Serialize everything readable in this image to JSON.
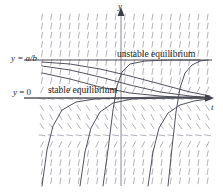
{
  "figure": {
    "background_color": "#ffffff",
    "width": 223,
    "height": 192
  },
  "axes": {
    "vertical": {
      "label": "y",
      "x_pixel": 121,
      "top_pixel": 8,
      "bottom_pixel": 186
    },
    "horizontal": {
      "label": "t",
      "y_pixel": 98,
      "left_pixel": 24,
      "right_pixel": 214
    },
    "axis_color": "#6b6b78"
  },
  "equilibria": [
    {
      "id": "unstable",
      "value_label": "y = a/b",
      "value_label_lhs": "y",
      "value_label_rhs": " = a/b",
      "annotation": "unstable equilibrium",
      "y_pixel": 60,
      "line_color": "#555555"
    },
    {
      "id": "stable",
      "value_label": "y = 0",
      "value_label_lhs": "y",
      "value_label_rhs": " = 0",
      "annotation": "stable equilibrium",
      "y_pixel": 98,
      "line_color": "#555555"
    }
  ],
  "direction_field": {
    "tick_color": "#9a9aa5",
    "x_start": 42,
    "x_step": 9.2,
    "x_count": 19,
    "y_start": 17,
    "y_step": 9.1,
    "y_count": 19,
    "tick_length": 6,
    "description": "short slope segments; near-horizontal at the two equilibria, steep positive above y=a/b, negative between the equilibria, steep positive below y=0"
  },
  "solution_curves": {
    "curve_color": "#4a4a55",
    "stroke_width": 0.9,
    "count": 8,
    "regions": [
      {
        "region": "above y = a/b",
        "behaviour": "diverges upward away from unstable equilibrium",
        "count": 2
      },
      {
        "region": "between y = 0 and y = a/b",
        "behaviour": "decays downward toward stable equilibrium y = 0",
        "count": 3
      },
      {
        "region": "below y = 0",
        "behaviour": "rises asymptotically toward stable equilibrium y = 0",
        "count": 3
      }
    ]
  },
  "chart_data": {
    "type": "line",
    "xlabel": "t",
    "ylabel": "y",
    "grid": false,
    "legend": "none",
    "xlim": [
      0,
      223
    ],
    "ylim": [
      192,
      0
    ],
    "annotations": [
      {
        "text": "unstable equilibrium",
        "x": 117,
        "y": 50
      },
      {
        "text": "stable equilibrium",
        "x": 48,
        "y": 86
      },
      {
        "text": "y = a/b",
        "x": 11,
        "y": 54
      },
      {
        "text": "y = 0",
        "x": 13,
        "y": 88
      }
    ],
    "series": [
      {
        "name": "equilibrium-unstable",
        "type": "horizontal-line",
        "y": 60
      },
      {
        "name": "equilibrium-stable",
        "type": "horizontal-line",
        "y": 98
      },
      {
        "name": "above-1",
        "points": [
          [
            103,
            186
          ],
          [
            108,
            150
          ],
          [
            113,
            110
          ],
          [
            117,
            86
          ],
          [
            122,
            72
          ],
          [
            130,
            64
          ],
          [
            145,
            61
          ],
          [
            170,
            60
          ],
          [
            200,
            60
          ]
        ]
      },
      {
        "name": "above-2",
        "points": [
          [
            168,
            186
          ],
          [
            172,
            148
          ],
          [
            176,
            112
          ],
          [
            180,
            88
          ],
          [
            185,
            73
          ],
          [
            192,
            65
          ],
          [
            200,
            61
          ],
          [
            208,
            60
          ]
        ]
      },
      {
        "name": "between-1",
        "points": [
          [
            42,
            62
          ],
          [
            70,
            64
          ],
          [
            100,
            69
          ],
          [
            130,
            76
          ],
          [
            160,
            84
          ],
          [
            190,
            92
          ],
          [
            210,
            96
          ]
        ]
      },
      {
        "name": "between-2",
        "points": [
          [
            42,
            66
          ],
          [
            70,
            70
          ],
          [
            100,
            77
          ],
          [
            130,
            85
          ],
          [
            160,
            92
          ],
          [
            190,
            96
          ],
          [
            210,
            98
          ]
        ]
      },
      {
        "name": "between-3",
        "points": [
          [
            42,
            73
          ],
          [
            70,
            79
          ],
          [
            100,
            87
          ],
          [
            130,
            93
          ],
          [
            160,
            96
          ],
          [
            190,
            98
          ],
          [
            210,
            98
          ]
        ]
      },
      {
        "name": "below-1",
        "points": [
          [
            42,
            186
          ],
          [
            47,
            150
          ],
          [
            53,
            126
          ],
          [
            62,
            110
          ],
          [
            76,
            102
          ],
          [
            95,
            99
          ],
          [
            120,
            98
          ],
          [
            160,
            97
          ],
          [
            205,
            97
          ]
        ]
      },
      {
        "name": "below-2",
        "points": [
          [
            80,
            186
          ],
          [
            85,
            152
          ],
          [
            91,
            128
          ],
          [
            100,
            112
          ],
          [
            113,
            103
          ],
          [
            132,
            99
          ],
          [
            160,
            98
          ],
          [
            200,
            97
          ]
        ]
      },
      {
        "name": "below-3",
        "points": [
          [
            148,
            186
          ],
          [
            153,
            152
          ],
          [
            159,
            128
          ],
          [
            168,
            113
          ],
          [
            180,
            105
          ],
          [
            194,
            101
          ],
          [
            208,
            99
          ]
        ]
      }
    ]
  }
}
